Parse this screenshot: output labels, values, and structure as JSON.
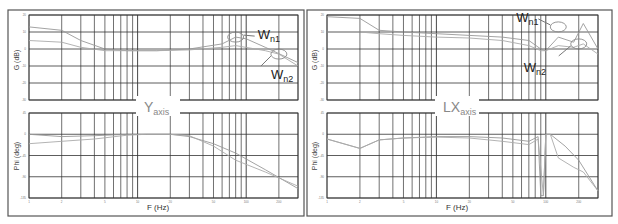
{
  "chart_data": [
    {
      "type": "line",
      "title": "Y axis",
      "panel_label": {
        "main": "Y",
        "sub": "axis"
      },
      "xlabel": "F (Hz)",
      "xscale": "log",
      "xlim": [
        1,
        300
      ],
      "grid": true,
      "subplots": [
        {
          "name": "gain",
          "ylabel": "G (dB)",
          "ylim": [
            -30,
            20
          ],
          "series": [
            {
              "name": "curve-a",
              "x": [
                1,
                2,
                3,
                5,
                8,
                15,
                30,
                60,
                80,
                100,
                150,
                300
              ],
              "y": [
                13,
                11,
                5,
                0,
                -1,
                -1,
                0,
                3,
                7,
                6,
                1,
                -8
              ]
            },
            {
              "name": "curve-b",
              "x": [
                1,
                2,
                3,
                5,
                8,
                15,
                30,
                60,
                80,
                150,
                200,
                300
              ],
              "y": [
                5,
                4,
                1,
                -1,
                -1,
                -1,
                -0.5,
                1,
                2,
                -1,
                -3,
                -10
              ]
            }
          ],
          "annotations": [
            {
              "label": "W",
              "sub": "n1",
              "x": 80,
              "y": 7
            },
            {
              "label": "W",
              "sub": "n2",
              "x": 200,
              "y": -3
            }
          ]
        },
        {
          "name": "phase",
          "ylabel": "Phi (deg)",
          "ylim": [
            -135,
            45
          ],
          "series": [
            {
              "name": "curve-a",
              "x": [
                1,
                2,
                4,
                8,
                12,
                20,
                30,
                50,
                80,
                150,
                300
              ],
              "y": [
                0,
                -5,
                -3,
                0,
                0,
                0,
                -5,
                -20,
                -40,
                -75,
                -115
              ]
            },
            {
              "name": "curve-b",
              "x": [
                1,
                2,
                4,
                8,
                12,
                20,
                30,
                50,
                80,
                150,
                300
              ],
              "y": [
                -20,
                -15,
                -10,
                -2,
                0,
                0,
                -3,
                -25,
                -55,
                -80,
                -110
              ]
            }
          ]
        }
      ]
    },
    {
      "type": "line",
      "title": "LX axis",
      "panel_label": {
        "main": "LX",
        "sub": "axis"
      },
      "xlabel": "F (Hz)",
      "xscale": "log",
      "xlim": [
        1,
        300
      ],
      "grid": true,
      "subplots": [
        {
          "name": "gain",
          "ylabel": "G (dB)",
          "ylim": [
            -30,
            20
          ],
          "series": [
            {
              "name": "curve-a",
              "x": [
                1,
                2,
                3,
                5,
                10,
                20,
                40,
                70,
                90,
                100,
                130,
                180,
                220,
                300
              ],
              "y": [
                19,
                18,
                11,
                10,
                9,
                8,
                7,
                5,
                0,
                -1,
                7,
                4,
                15,
                0
              ]
            },
            {
              "name": "curve-b",
              "x": [
                1,
                2,
                3,
                5,
                10,
                20,
                40,
                70,
                90,
                100,
                130,
                180,
                220,
                300
              ],
              "y": [
                10,
                10,
                9,
                8,
                7,
                6.5,
                5,
                2,
                -1,
                -1,
                2,
                1,
                3,
                -3
              ]
            }
          ],
          "annotations": [
            {
              "label": "W",
              "sub": "n1",
              "x": 130,
              "y": 13
            },
            {
              "label": "W",
              "sub": "n2",
              "x": 200,
              "y": 3
            }
          ]
        },
        {
          "name": "phase",
          "ylabel": "Phi (deg)",
          "ylim": [
            -135,
            45
          ],
          "series": [
            {
              "name": "curve-a",
              "x": [
                1,
                2,
                3,
                5,
                10,
                20,
                40,
                70,
                85,
                90,
                95,
                100,
                110,
                150,
                200,
                300
              ],
              "y": [
                -10,
                -30,
                -12,
                -8,
                -5,
                -5,
                -8,
                -15,
                -5,
                -130,
                -130,
                0,
                0,
                -25,
                -55,
                -120
              ]
            },
            {
              "name": "curve-b",
              "x": [
                1,
                2,
                3,
                5,
                10,
                20,
                40,
                70,
                85,
                95,
                100,
                110,
                130,
                180,
                220,
                300
              ],
              "y": [
                -10,
                -30,
                -12,
                -8,
                -6,
                -8,
                -15,
                -22,
                -10,
                -130,
                0,
                0,
                -50,
                -70,
                -80,
                -120
              ]
            }
          ]
        }
      ]
    }
  ],
  "labels": {
    "left_g_ylabel": "G (dB)",
    "left_phi_ylabel": "Phi (deg)",
    "right_g_ylabel": "G (dB)",
    "right_phi_ylabel": "Phi (deg)",
    "left_xlabel": "F (Hz)",
    "right_xlabel": "F (Hz)",
    "left_axis_main": "Y",
    "left_axis_sub": "axis",
    "right_axis_main": "LX",
    "right_axis_sub": "axis",
    "wn_main": "W",
    "wn1_sub": "n1",
    "wn2_sub": "n2"
  },
  "ticks": {
    "g_y": [
      "20",
      "10",
      "0",
      "-10",
      "-20",
      "-30"
    ],
    "phi_y": [
      "45",
      "0",
      "-45",
      "-90",
      "-135"
    ],
    "x": [
      "1",
      "2",
      "5",
      "10",
      "20",
      "50",
      "100",
      "200"
    ]
  }
}
